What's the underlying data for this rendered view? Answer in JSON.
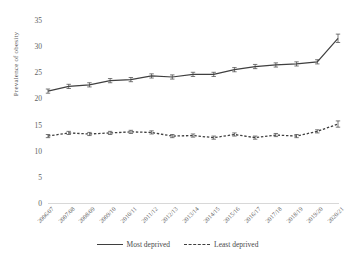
{
  "chart_data": {
    "type": "line",
    "title": "",
    "xlabel": "",
    "ylabel": "Prevalence of obesity",
    "ylim": [
      0,
      35
    ],
    "yticks": [
      0,
      5,
      10,
      15,
      20,
      25,
      30,
      35
    ],
    "grid": false,
    "legend_position": "bottom",
    "categories": [
      "2006/07",
      "2007/08",
      "2008/09",
      "2009/10",
      "2010/11",
      "2011/12",
      "2012/13",
      "2013/14",
      "2014/15",
      "2015/16",
      "2016/17",
      "2017/18",
      "2018/19",
      "2019/20",
      "2020/21"
    ],
    "series": [
      {
        "name": "Most deprived",
        "style": "solid",
        "color": "#3f3f3f",
        "values": [
          21.4,
          22.3,
          22.6,
          23.4,
          23.6,
          24.3,
          24.1,
          24.6,
          24.6,
          25.5,
          26.1,
          26.4,
          26.6,
          27.0,
          31.5
        ],
        "error_low": [
          21.0,
          21.9,
          22.2,
          23.0,
          23.2,
          23.9,
          23.7,
          24.2,
          24.2,
          25.1,
          25.7,
          26.0,
          26.2,
          26.6,
          30.7
        ],
        "error_high": [
          21.8,
          22.7,
          23.0,
          23.8,
          24.0,
          24.7,
          24.5,
          25.0,
          25.0,
          25.9,
          26.5,
          26.8,
          27.0,
          27.4,
          32.3
        ]
      },
      {
        "name": "Least deprived",
        "style": "dashed",
        "color": "#3f3f3f",
        "values": [
          12.8,
          13.4,
          13.2,
          13.4,
          13.6,
          13.5,
          12.8,
          12.9,
          12.5,
          13.1,
          12.5,
          13.0,
          12.8,
          13.7,
          15.1
        ],
        "error_low": [
          12.5,
          13.1,
          12.9,
          13.1,
          13.3,
          13.2,
          12.5,
          12.6,
          12.2,
          12.8,
          12.2,
          12.7,
          12.5,
          13.4,
          14.5
        ],
        "error_high": [
          13.1,
          13.7,
          13.5,
          13.7,
          13.9,
          13.8,
          13.1,
          13.2,
          12.8,
          13.4,
          12.8,
          13.3,
          13.1,
          14.0,
          15.7
        ]
      }
    ]
  },
  "legend": {
    "entries": [
      {
        "label": "Most deprived"
      },
      {
        "label": "Least deprived"
      }
    ]
  }
}
